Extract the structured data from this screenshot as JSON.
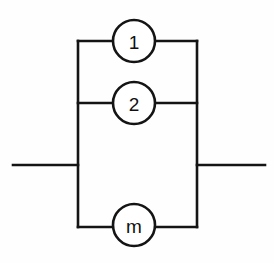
{
  "figure": {
    "kind": "reliability-block-diagram",
    "background_color": "#fefefe",
    "line_color": "#141414",
    "label_color": "#111111",
    "fill_color": "#ffffff",
    "stroke_width": 2.6,
    "canvas": {
      "width": 274,
      "height": 263
    }
  },
  "geometry": {
    "rect_left_x": 78,
    "rect_right_x": 197,
    "rect_top_y": 41,
    "rect_bottom_y": 227,
    "branch_middle_y": 103,
    "lead_y": 165,
    "lead_left_start_x": 13,
    "lead_right_end_x": 265,
    "node_center_x": 134,
    "node_radius": 21
  },
  "blocks": [
    {
      "id": "block-1",
      "label": "1",
      "cx": 134,
      "cy": 41,
      "r": 21,
      "branch": "top"
    },
    {
      "id": "block-2",
      "label": "2",
      "cx": 134,
      "cy": 103,
      "r": 21,
      "branch": "middle"
    },
    {
      "id": "block-m",
      "label": "m",
      "cx": 134,
      "cy": 225,
      "r": 21,
      "branch": "bottom"
    }
  ],
  "connectors": {
    "left_lead_label": "input-lead",
    "right_lead_label": "output-lead",
    "left_rail_label": "left-bus",
    "right_rail_label": "right-bus"
  }
}
